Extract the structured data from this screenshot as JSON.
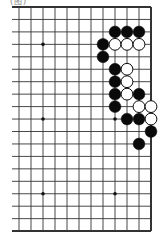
{
  "caption": "(图)",
  "board": {
    "description": "Partial 19x19 Go board showing columns 8-19 (right side), all 19 rows",
    "visible_columns": 12,
    "visible_rows": 19,
    "origin": {
      "x": 19,
      "y": 7
    },
    "spacing": {
      "x": 12,
      "y": 12.45
    },
    "left_extension": 7,
    "edges": {
      "top": true,
      "right": true,
      "bottom": true,
      "left": false
    },
    "line_color": "#333333",
    "star_points": [
      [
        2,
        3
      ],
      [
        2,
        9
      ],
      [
        2,
        15
      ],
      [
        8,
        3
      ],
      [
        8,
        9
      ],
      [
        8,
        15
      ]
    ],
    "stones": [
      {
        "col": 8,
        "row": 2,
        "color": "black"
      },
      {
        "col": 9,
        "row": 2,
        "color": "black"
      },
      {
        "col": 10,
        "row": 2,
        "color": "black"
      },
      {
        "col": 7,
        "row": 3,
        "color": "black"
      },
      {
        "col": 8,
        "row": 3,
        "color": "white"
      },
      {
        "col": 9,
        "row": 3,
        "color": "white"
      },
      {
        "col": 10,
        "row": 3,
        "color": "white"
      },
      {
        "col": 7,
        "row": 4,
        "color": "black"
      },
      {
        "col": 8,
        "row": 5,
        "color": "black"
      },
      {
        "col": 9,
        "row": 5,
        "color": "white"
      },
      {
        "col": 8,
        "row": 6,
        "color": "black"
      },
      {
        "col": 9,
        "row": 6,
        "color": "white"
      },
      {
        "col": 8,
        "row": 7,
        "color": "black"
      },
      {
        "col": 9,
        "row": 7,
        "color": "white"
      },
      {
        "col": 10,
        "row": 7,
        "color": "black"
      },
      {
        "col": 8,
        "row": 8,
        "color": "black"
      },
      {
        "col": 10,
        "row": 8,
        "color": "white"
      },
      {
        "col": 11,
        "row": 8,
        "color": "white"
      },
      {
        "col": 9,
        "row": 9,
        "color": "black"
      },
      {
        "col": 10,
        "row": 9,
        "color": "black"
      },
      {
        "col": 11,
        "row": 9,
        "color": "white"
      },
      {
        "col": 11,
        "row": 10,
        "color": "black"
      },
      {
        "col": 10,
        "row": 11,
        "color": "black"
      }
    ]
  }
}
